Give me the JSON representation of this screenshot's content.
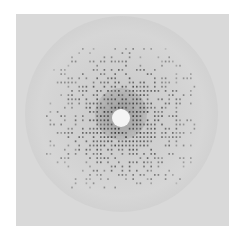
{
  "image": {
    "subject": "X-ray diffraction pattern",
    "description": "Grayscale crystal diffraction image with lattice of dark spots around a central white beam stop, enclosed by a circular gray disc on a light square background",
    "colors": {
      "background": "#ffffff",
      "plate": "#d9d9d9",
      "disc_edge": "#bdbdbd",
      "spot": "#3a3a3a",
      "beamstop": "#f4f4f4"
    }
  }
}
